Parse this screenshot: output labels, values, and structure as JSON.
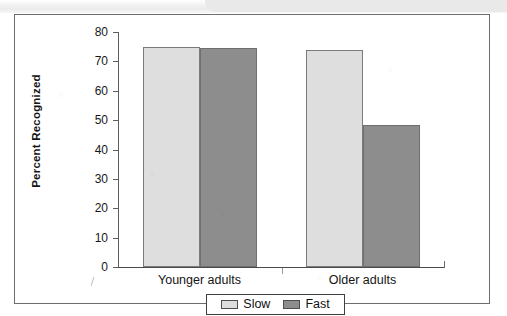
{
  "figure": {
    "frame_visible": true,
    "background_color": "#ffffff",
    "scan_band_color": "#e9e9e9"
  },
  "chart_data": {
    "type": "bar",
    "title": "",
    "subtitle": "",
    "xlabel": "",
    "ylabel": "Percent Recognized",
    "categories": [
      "Younger adults",
      "Older adults"
    ],
    "series": [
      {
        "name": "Slow",
        "values": [
          75,
          74
        ],
        "color": "#dedede"
      },
      {
        "name": "Fast",
        "values": [
          74.5,
          48.5
        ],
        "color": "#8d8d8d"
      }
    ],
    "ylim": [
      0,
      80
    ],
    "ytick_values": [
      0,
      10,
      20,
      30,
      40,
      50,
      60,
      70,
      80
    ],
    "ytick_labels": [
      "0",
      "10",
      "20",
      "30",
      "40",
      "50",
      "60",
      "70",
      "80"
    ],
    "grid": false,
    "legend_position": "bottom-center",
    "legend_entries": [
      "Slow",
      "Fast"
    ],
    "annotations": []
  },
  "axes": {
    "y_title": "Percent Recognized",
    "ticks": [
      {
        "label": "80",
        "value": 80
      },
      {
        "label": "70",
        "value": 70
      },
      {
        "label": "60",
        "value": 60
      },
      {
        "label": "50",
        "value": 50
      },
      {
        "label": "40",
        "value": 40
      },
      {
        "label": "30",
        "value": 30
      },
      {
        "label": "20",
        "value": 20
      },
      {
        "label": "10",
        "value": 10
      },
      {
        "label": "0",
        "value": 0
      }
    ],
    "x_categories": [
      {
        "label": "Younger adults"
      },
      {
        "label": "Older adults"
      }
    ]
  },
  "legend": {
    "entries": [
      {
        "label": "Slow",
        "color": "#dedede"
      },
      {
        "label": "Fast",
        "color": "#8d8d8d"
      }
    ]
  }
}
